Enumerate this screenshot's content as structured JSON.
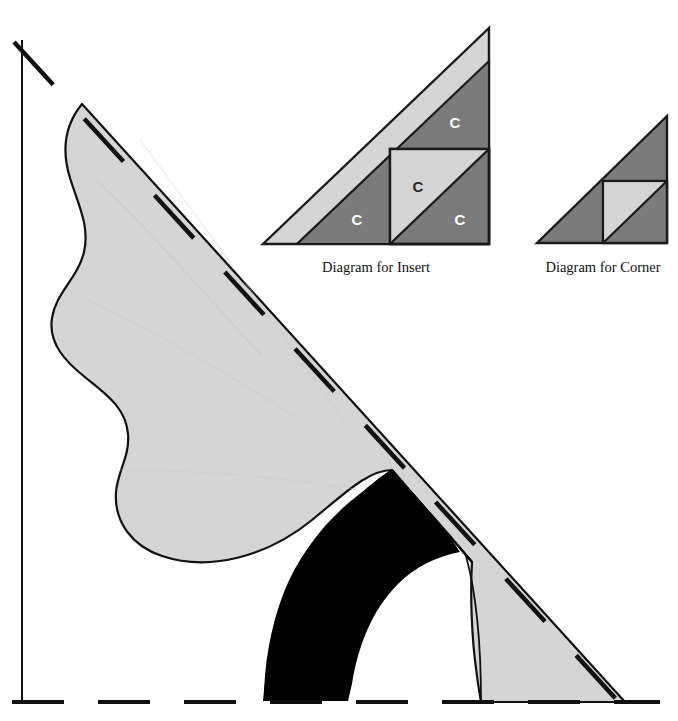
{
  "page": {
    "background_color": "#ffffff",
    "width": 678,
    "height": 721
  },
  "colors": {
    "light_gray": "#d5d5d5",
    "mid_gray": "#d9d9d9",
    "dark_gray": "#7b7b7b",
    "black": "#000000",
    "outline": "#1a1a1a",
    "white": "#ffffff"
  },
  "main_pattern": {
    "name": "main-pattern-piece",
    "light_shape_fill": "#d5d5d5",
    "black_shape_fill": "#000000",
    "outline_color": "#111111",
    "guides": {
      "vertical_line": {
        "x": 22,
        "y1": 40,
        "y2": 703,
        "style": "solid"
      },
      "horizontal_line": {
        "y": 702,
        "x1": 12,
        "x2": 660,
        "style": "dashed"
      },
      "diagonal_line": {
        "x1": 14,
        "y1": 42,
        "x2": 628,
        "y2": 712,
        "style": "dashed"
      }
    }
  },
  "insert_diagram": {
    "caption": "Diagram for Insert",
    "triangle": {
      "left_x": 263,
      "right_x": 489,
      "bottom_y": 244,
      "top_y": 28
    },
    "outer_strip_fill": "#d5d5d5",
    "body_fill": "#7b7b7b",
    "inner_square": {
      "x": 390,
      "y": 149,
      "size": 96
    },
    "inner_light_fill": "#d5d5d5",
    "labels": [
      {
        "text": "C",
        "x": 455,
        "y": 128,
        "tone": "light"
      },
      {
        "text": "C",
        "x": 418,
        "y": 186,
        "tone": "dark"
      },
      {
        "text": "C",
        "x": 357,
        "y": 221,
        "tone": "light"
      },
      {
        "text": "C",
        "x": 460,
        "y": 221,
        "tone": "light"
      }
    ]
  },
  "corner_diagram": {
    "caption": "Diagram for Corner",
    "triangle": {
      "left_x": 537,
      "right_x": 667,
      "bottom_y": 243,
      "top_y": 116
    },
    "body_fill": "#7b7b7b",
    "inner_square": {
      "x": 603,
      "y": 181,
      "size": 64
    },
    "inner_light_fill": "#d5d5d5",
    "labels": []
  }
}
